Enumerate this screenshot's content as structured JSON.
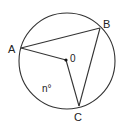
{
  "diagram": {
    "type": "circle-geometry",
    "colors": {
      "stroke": "#333333",
      "text": "#222222",
      "background": "#ffffff"
    },
    "circle": {
      "cx": 67,
      "cy": 61,
      "r": 48
    },
    "points": {
      "A": {
        "label": "A",
        "x": 21,
        "y": 48
      },
      "B": {
        "label": "B",
        "x": 100,
        "y": 28
      },
      "C": {
        "label": "C",
        "x": 79,
        "y": 106
      },
      "O": {
        "label": "0",
        "x": 66,
        "y": 60
      }
    },
    "segments": [
      {
        "from": "A",
        "to": "B"
      },
      {
        "from": "B",
        "to": "C"
      },
      {
        "from": "A",
        "to": "O"
      },
      {
        "from": "O",
        "to": "C"
      }
    ],
    "angle_label": "n°"
  }
}
